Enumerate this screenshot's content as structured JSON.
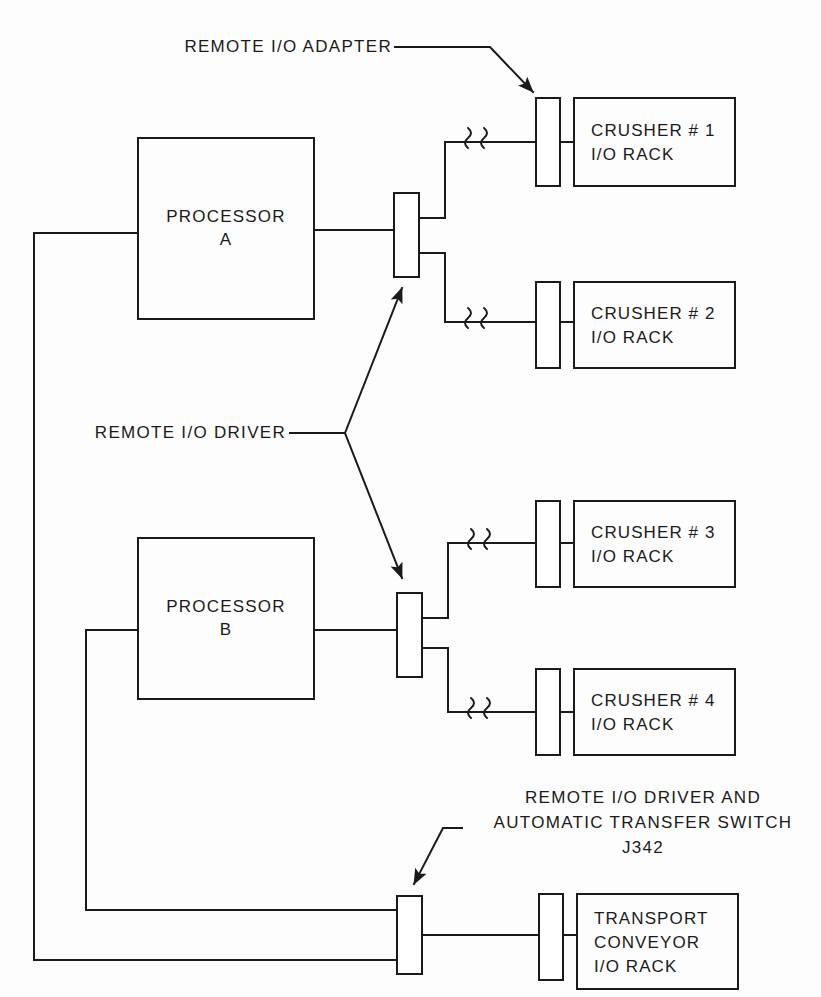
{
  "diagram": {
    "line_color": "#1a1a1a",
    "background": "#fdfdfd"
  },
  "annotations": {
    "adapter": {
      "text": "REMOTE I/O ADAPTER",
      "leader": "arrow-down-right"
    },
    "driver": {
      "text": "REMOTE I/O DRIVER",
      "leader": "branch-two-arrows"
    },
    "transfer_switch": {
      "line1": "REMOTE I/O DRIVER AND",
      "line2": "AUTOMATIC TRANSFER SWITCH",
      "line3": "J342",
      "leader": "arrow-down-left"
    }
  },
  "processors": [
    {
      "name": "processor-a",
      "line1": "PROCESSOR",
      "line2": "A"
    },
    {
      "name": "processor-b",
      "line1": "PROCESSOR",
      "line2": "B"
    }
  ],
  "racks": [
    {
      "name": "crusher-1",
      "line1": "CRUSHER # 1",
      "line2": "I/O RACK"
    },
    {
      "name": "crusher-2",
      "line1": "CRUSHER # 2",
      "line2": "I/O RACK"
    },
    {
      "name": "crusher-3",
      "line1": "CRUSHER # 3",
      "line2": "I/O RACK"
    },
    {
      "name": "crusher-4",
      "line1": "CRUSHER # 4",
      "line2": "I/O RACK"
    },
    {
      "name": "transport-conveyor",
      "line1": "TRANSPORT",
      "line2": "CONVEYOR",
      "line3": "I/O RACK"
    }
  ],
  "modules": {
    "driver_a": "remote-io-driver-a",
    "driver_b": "remote-io-driver-b",
    "transfer_switch": "remote-io-driver-and-automatic-transfer-switch",
    "adapter_1": "remote-io-adapter-crusher-1",
    "adapter_2": "remote-io-adapter-crusher-2",
    "adapter_3": "remote-io-adapter-crusher-3",
    "adapter_4": "remote-io-adapter-crusher-4",
    "adapter_5": "remote-io-adapter-transport-conveyor"
  },
  "cable_breaks": {
    "symbol": "squiggle-break",
    "count": 5
  }
}
